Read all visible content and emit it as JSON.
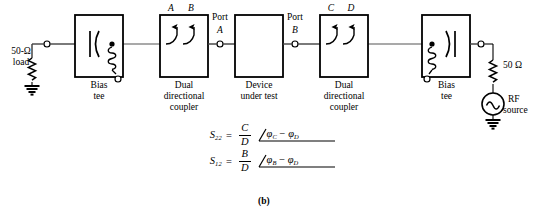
{
  "figure": {
    "caption": "(b)"
  },
  "colors": {
    "line": "#000000",
    "background": "#ffffff",
    "trace": "#555555"
  },
  "labels": {
    "load": {
      "line1": "50-Ω",
      "line2": "load"
    },
    "bias_tee_left": {
      "line1": "Bias",
      "line2": "tee"
    },
    "coupler_left": {
      "line1": "Dual",
      "line2": "directional",
      "line3": "coupler"
    },
    "dut": {
      "line1": "Device",
      "line2": "under test"
    },
    "coupler_right": {
      "line1": "Dual",
      "line2": "directional",
      "line3": "coupler"
    },
    "bias_tee_right": {
      "line1": "Bias",
      "line2": "tee"
    },
    "source": {
      "resistor": "50 Ω",
      "line1": "RF",
      "line2": "source"
    },
    "port_a": {
      "line1": "Port",
      "line2": "A"
    },
    "port_b": {
      "line1": "Port",
      "line2": "B"
    },
    "coupler_left_taps": {
      "a": "A",
      "b": "B"
    },
    "coupler_right_taps": {
      "c": "C",
      "d": "D"
    }
  },
  "equations": [
    {
      "name": "s22",
      "lhs": "S",
      "lhs_sub": "22",
      "equals": "=",
      "numerator": "C",
      "denominator": "D",
      "angle_symbol": "∠",
      "phase_first": "φ",
      "phase_first_sub": "C",
      "operator": "−",
      "phase_second": "φ",
      "phase_second_sub": "D",
      "plain": "S22 = C/D ∠ φC − φD"
    },
    {
      "name": "s12",
      "lhs": "S",
      "lhs_sub": "12",
      "equals": "=",
      "numerator": "B",
      "denominator": "D",
      "angle_symbol": "∠",
      "phase_first": "φ",
      "phase_first_sub": "B",
      "operator": "−",
      "phase_second": "φ",
      "phase_second_sub": "D",
      "plain": "S12 = B/D ∠ φB − φD"
    }
  ],
  "components": {
    "blocks": [
      {
        "name": "bias-tee-left",
        "label": "Bias tee"
      },
      {
        "name": "coupler-left",
        "label": "Dual directional coupler"
      },
      {
        "name": "dut",
        "label": "Device under test"
      },
      {
        "name": "coupler-right",
        "label": "Dual directional coupler"
      },
      {
        "name": "bias-tee-right",
        "label": "Bias tee"
      }
    ]
  }
}
